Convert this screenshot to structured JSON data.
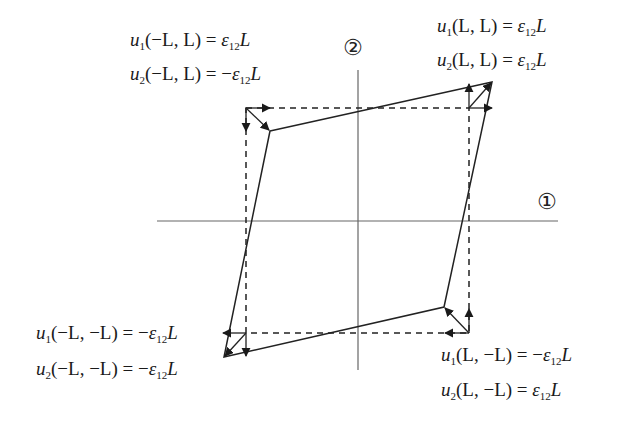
{
  "diagram": {
    "axes": {
      "axis1_label": "①",
      "axis2_label": "②"
    },
    "colors": {
      "line": "#222222",
      "axis": "#555555",
      "background": "#ffffff"
    },
    "equations": {
      "top_left": {
        "u1": {
          "func": "u",
          "sub": "1",
          "args": "(−L, L)",
          "rhs_sign": "",
          "rhs_eps": "ε",
          "rhs_sub": "12",
          "rhs_L": "L"
        },
        "u2": {
          "func": "u",
          "sub": "2",
          "args": "(−L, L)",
          "rhs_sign": "−",
          "rhs_eps": "ε",
          "rhs_sub": "12",
          "rhs_L": "L"
        }
      },
      "top_right": {
        "u1": {
          "func": "u",
          "sub": "1",
          "args": "(L, L)",
          "rhs_sign": "",
          "rhs_eps": "ε",
          "rhs_sub": "12",
          "rhs_L": "L"
        },
        "u2": {
          "func": "u",
          "sub": "2",
          "args": "(L, L)",
          "rhs_sign": "",
          "rhs_eps": "ε",
          "rhs_sub": "12",
          "rhs_L": "L"
        }
      },
      "bottom_left": {
        "u1": {
          "func": "u",
          "sub": "1",
          "args": "(−L, −L)",
          "rhs_sign": "−",
          "rhs_eps": "ε",
          "rhs_sub": "12",
          "rhs_L": "L"
        },
        "u2": {
          "func": "u",
          "sub": "2",
          "args": "(−L, −L)",
          "rhs_sign": "−",
          "rhs_eps": "ε",
          "rhs_sub": "12",
          "rhs_L": "L"
        }
      },
      "bottom_right": {
        "u1": {
          "func": "u",
          "sub": "1",
          "args": "(L, −L)",
          "rhs_sign": "−",
          "rhs_eps": "ε",
          "rhs_sub": "12",
          "rhs_L": "L"
        },
        "u2": {
          "func": "u",
          "sub": "2",
          "args": "(L, −L)",
          "rhs_sign": "",
          "rhs_eps": "ε",
          "rhs_sub": "12",
          "rhs_L": "L"
        }
      }
    },
    "equals": "="
  }
}
